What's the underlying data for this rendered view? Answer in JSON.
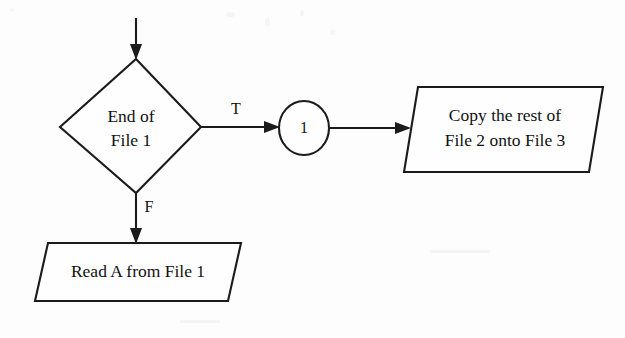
{
  "diagram": {
    "type": "flowchart",
    "background_color": "#fdfdfd",
    "line_color": "#1b1b1b",
    "text_color": "#111111",
    "nodes": [
      {
        "id": "entry",
        "shape": "arrow-in",
        "label": ""
      },
      {
        "id": "decision",
        "shape": "diamond",
        "label_line1": "End of",
        "label_line2": "File 1"
      },
      {
        "id": "connector",
        "shape": "circle",
        "label": "1"
      },
      {
        "id": "copy-rest",
        "shape": "parallelogram",
        "label_line1": "Copy the rest of",
        "label_line2": "File 2 onto File 3"
      },
      {
        "id": "read-a",
        "shape": "parallelogram",
        "label_line1": "Read A from File 1"
      }
    ],
    "edges": [
      {
        "id": "entry-to-decision",
        "label": "",
        "from": "entry",
        "to": "decision"
      },
      {
        "id": "decision-true",
        "label": "T",
        "from": "decision",
        "to": "connector"
      },
      {
        "id": "connector-to-copy",
        "label": "",
        "from": "connector",
        "to": "copy-rest"
      },
      {
        "id": "decision-false",
        "label": "F",
        "from": "decision",
        "to": "read-a"
      }
    ]
  }
}
